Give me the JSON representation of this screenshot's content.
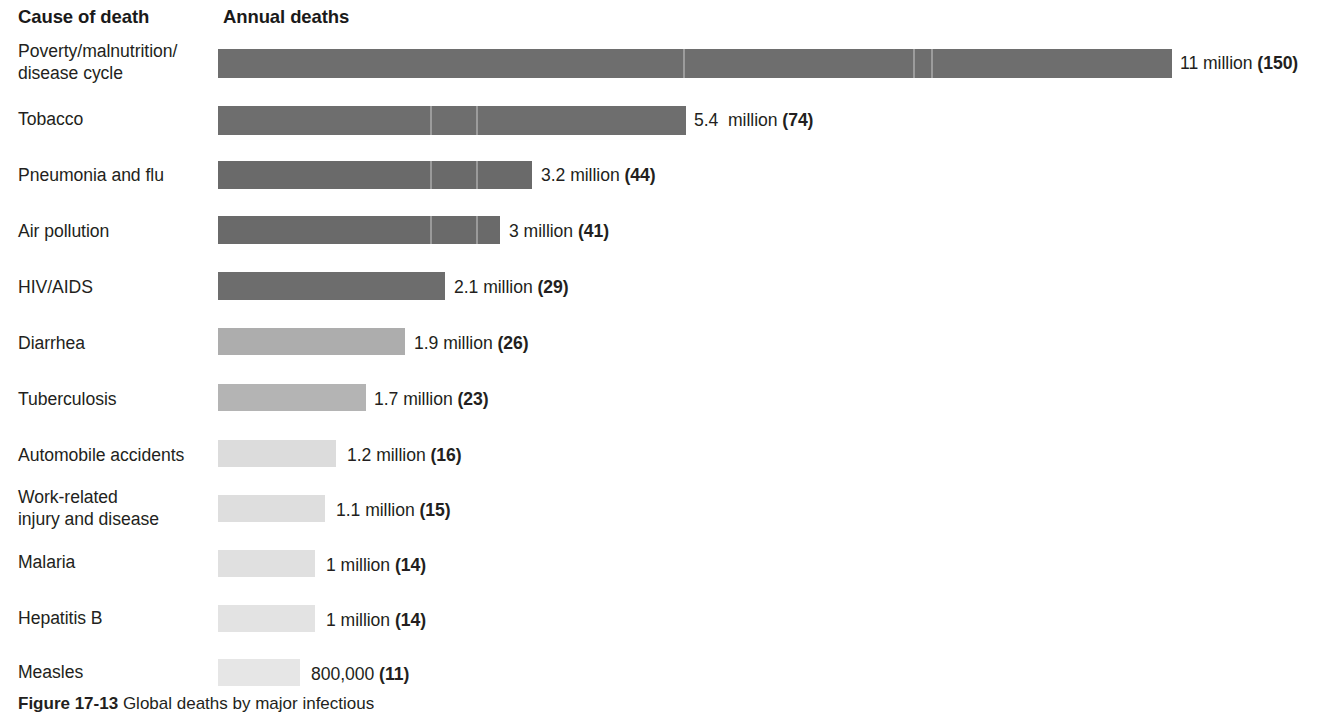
{
  "header": {
    "cause_label": "Cause of death",
    "deaths_label": "Annual deaths"
  },
  "caption": {
    "figure_number": "Figure 17-13",
    "text": " Global deaths by major infectious"
  },
  "colors": {
    "text": "#231f20",
    "bar_darkest": "#6e6e6e",
    "bar_lightest": "#e6e6e6",
    "background": "#ffffff"
  },
  "chart_data": {
    "type": "bar",
    "orientation": "horizontal",
    "title": "",
    "xlabel": "Annual deaths",
    "ylabel": "Cause of death",
    "grid": false,
    "legend": "none",
    "xlim": [
      0,
      11
    ],
    "categories": [
      "Poverty/malnutrition/\ndisease cycle",
      "Tobacco",
      "Pneumonia and flu",
      "Air pollution",
      "HIV/AIDS",
      "Diarrhea",
      "Tuberculosis",
      "Automobile accidents",
      "Work-related\ninjury and disease",
      "Malaria",
      "Hepatitis B",
      "Measles"
    ],
    "values": [
      11,
      5.4,
      3.2,
      3,
      2.1,
      1.9,
      1.7,
      1.2,
      1.1,
      1,
      1,
      0.8
    ],
    "value_labels": [
      "11 million (150)",
      "5.4  million (74)",
      "3.2 million (44)",
      "3 million (41)",
      "2.1 million (29)",
      "1.9 million (26)",
      "1.7 million (23)",
      "1.2 million (16)",
      "1.1 million (15)",
      "1 million (14)",
      "1 million (14)",
      "800,000 (11)"
    ],
    "rows": [
      {
        "label_line1": "Poverty/malnutrition/",
        "label_line2": "disease cycle",
        "value": 11,
        "value_main": "11 million ",
        "value_paren": "(150)",
        "bar_color": "#6e6e6e",
        "bar_width_px": 954,
        "top": 36,
        "label_top": 40,
        "bar_top": 49,
        "bar_height": 29,
        "value_left": 1180,
        "value_top": 53,
        "seams": [
          465,
          695,
          713,
          995
        ]
      },
      {
        "label_line1": "Tobacco",
        "label_line2": "",
        "value": 5.4,
        "value_main": "5.4  million ",
        "value_paren": "(74)",
        "bar_color": "#6e6e6e",
        "bar_width_px": 468,
        "top": 100,
        "label_top": 108,
        "bar_top": 106,
        "bar_height": 29,
        "value_left": 694,
        "value_top": 110,
        "seams": [
          212,
          258
        ]
      },
      {
        "label_line1": "Pneumonia and flu",
        "label_line2": "",
        "value": 3.2,
        "value_main": "3.2 million ",
        "value_paren": "(44)",
        "bar_color": "#6a6a6a",
        "bar_width_px": 314,
        "top": 158,
        "label_top": 164,
        "bar_top": 161,
        "bar_height": 28,
        "value_left": 541,
        "value_top": 165,
        "seams": [
          212,
          258
        ]
      },
      {
        "label_line1": "Air pollution",
        "label_line2": "",
        "value": 3,
        "value_main": "3 million ",
        "value_paren": "(41)",
        "bar_color": "#6a6a6a",
        "bar_width_px": 282,
        "top": 214,
        "label_top": 220,
        "bar_top": 216,
        "bar_height": 28,
        "value_left": 509,
        "value_top": 221,
        "seams": [
          212,
          258
        ]
      },
      {
        "label_line1": "HIV/AIDS",
        "label_line2": "",
        "value": 2.1,
        "value_main": "2.1 million ",
        "value_paren": "(29)",
        "bar_color": "#6d6d6d",
        "bar_width_px": 227,
        "top": 270,
        "label_top": 276,
        "bar_top": 272,
        "bar_height": 28,
        "value_left": 454,
        "value_top": 277,
        "seams": []
      },
      {
        "label_line1": "Diarrhea",
        "label_line2": "",
        "value": 1.9,
        "value_main": "1.9 million ",
        "value_paren": "(26)",
        "bar_color": "#adadad",
        "bar_width_px": 187,
        "top": 326,
        "label_top": 332,
        "bar_top": 328,
        "bar_height": 27,
        "value_left": 414,
        "value_top": 333,
        "seams": []
      },
      {
        "label_line1": "Tuberculosis",
        "label_line2": "",
        "value": 1.7,
        "value_main": "1.7 million ",
        "value_paren": "(23)",
        "bar_color": "#b4b4b4",
        "bar_width_px": 148,
        "top": 382,
        "label_top": 388,
        "bar_top": 384,
        "bar_height": 27,
        "value_left": 374,
        "value_top": 389,
        "seams": []
      },
      {
        "label_line1": "Automobile accidents",
        "label_line2": "",
        "value": 1.2,
        "value_main": "1.2 million ",
        "value_paren": "(16)",
        "bar_color": "#dcdcdc",
        "bar_width_px": 118,
        "top": 438,
        "label_top": 444,
        "bar_top": 440,
        "bar_height": 27,
        "value_left": 347,
        "value_top": 445,
        "seams": []
      },
      {
        "label_line1": "Work-related",
        "label_line2": "injury and disease",
        "value": 1.1,
        "value_main": "1.1 million ",
        "value_paren": "(15)",
        "bar_color": "#dedede",
        "bar_width_px": 107,
        "top": 486,
        "label_top": 486,
        "bar_top": 495,
        "bar_height": 27,
        "value_left": 336,
        "value_top": 500,
        "seams": []
      },
      {
        "label_line1": "Malaria",
        "label_line2": "",
        "value": 1,
        "value_main": "1 million ",
        "value_paren": "(14)",
        "bar_color": "#e0e0e0",
        "bar_width_px": 97,
        "top": 548,
        "label_top": 551,
        "bar_top": 550,
        "bar_height": 27,
        "value_left": 326,
        "value_top": 555,
        "seams": []
      },
      {
        "label_line1": "Hepatitis B",
        "label_line2": "",
        "value": 1,
        "value_main": "1 million ",
        "value_paren": "(14)",
        "bar_color": "#e3e3e3",
        "bar_width_px": 97,
        "top": 604,
        "label_top": 607,
        "bar_top": 605,
        "bar_height": 27,
        "value_left": 326,
        "value_top": 610,
        "seams": []
      },
      {
        "label_line1": "Measles",
        "label_line2": "",
        "value": 0.8,
        "value_main": "800,000 ",
        "value_paren": "(11)",
        "bar_color": "#e6e6e6",
        "bar_width_px": 82,
        "top": 658,
        "label_top": 661,
        "bar_top": 659,
        "bar_height": 27,
        "value_left": 311,
        "value_top": 664,
        "seams": []
      }
    ]
  }
}
